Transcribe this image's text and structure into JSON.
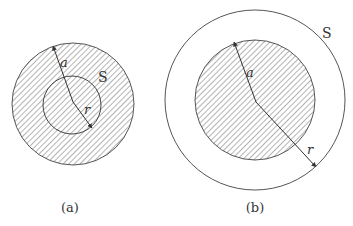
{
  "figure": {
    "panels": [
      {
        "id": "a",
        "caption": "(a)",
        "surface_label": "S",
        "radius_label_a": "a",
        "radius_label_r": "r",
        "description": "Shaded sphere of radius a with Gaussian surface S of radius r inside (r < a)",
        "outer_circle": {
          "cx": 73,
          "cy": 104,
          "r": 61,
          "shaded": true
        },
        "inner_circle": {
          "cx": 72,
          "cy": 105,
          "r": 29,
          "shaded": true
        }
      },
      {
        "id": "b",
        "caption": "(b)",
        "surface_label": "S",
        "radius_label_a": "a",
        "radius_label_r": "r",
        "description": "Shaded sphere of radius a with Gaussian surface S of radius r outside (r > a)",
        "outer_circle": {
          "cx": 255,
          "cy": 100,
          "r": 90,
          "shaded": false
        },
        "inner_circle": {
          "cx": 255,
          "cy": 100,
          "r": 60,
          "shaded": true
        }
      }
    ],
    "colors": {
      "stroke": "#555555",
      "hatch": "#666666",
      "background": "#ffffff"
    }
  }
}
